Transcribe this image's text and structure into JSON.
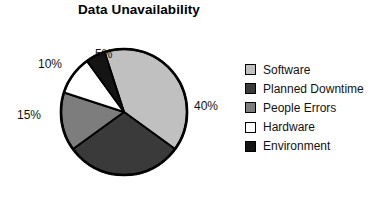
{
  "chart_data": {
    "type": "pie",
    "title": "Data Unavailability",
    "xlabel": "",
    "ylabel": "",
    "grid": false,
    "legend_position": "right",
    "start_angle_deg": 0,
    "direction": "clockwise",
    "units": "percent",
    "categories": [
      "Software",
      "Planned Downtime",
      "People Errors",
      "Hardware",
      "Environment"
    ],
    "values": [
      40,
      30,
      15,
      10,
      5
    ],
    "value_labels": [
      "40%",
      "30%",
      "15%",
      "10%",
      "5%"
    ],
    "colors": [
      "#c0c0c0",
      "#3a3a3a",
      "#7d7d7d",
      "#ffffff",
      "#141414"
    ],
    "slices": [
      {
        "label": "Software",
        "value": 40,
        "value_label": "40%",
        "color": "#c0c0c0"
      },
      {
        "label": "Planned Downtime",
        "value": 30,
        "value_label": "30%",
        "color": "#3a3a3a"
      },
      {
        "label": "People Errors",
        "value": 15,
        "value_label": "15%",
        "color": "#7d7d7d"
      },
      {
        "label": "Hardware",
        "value": 10,
        "value_label": "10%",
        "color": "#ffffff"
      },
      {
        "label": "Environment",
        "value": 5,
        "value_label": "5%",
        "color": "#141414"
      }
    ]
  },
  "title": "Data Unavailability",
  "pie": {
    "labels": {
      "software": "40%",
      "downtime": "30%",
      "people": "15%",
      "hardware": "10%",
      "environment": "5%"
    }
  },
  "legend": {
    "items": [
      {
        "label": "Software",
        "color": "#c0c0c0"
      },
      {
        "label": "Planned Downtime",
        "color": "#3a3a3a"
      },
      {
        "label": "People Errors",
        "color": "#7d7d7d"
      },
      {
        "label": "Hardware",
        "color": "#ffffff"
      },
      {
        "label": "Environment",
        "color": "#141414"
      }
    ]
  },
  "style": {
    "outline_color": "#000000",
    "background": "#ffffff",
    "text_color": "#111111"
  }
}
